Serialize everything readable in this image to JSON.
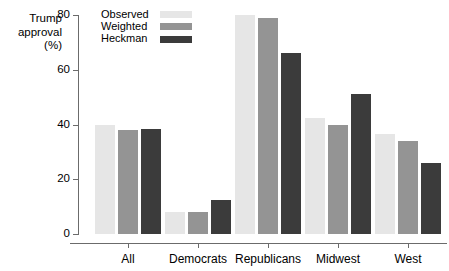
{
  "chart_data": {
    "type": "bar",
    "title": "",
    "ylabel": "Trump approval (%)",
    "ylabel_lines": [
      "Trump",
      "approval",
      "(%)"
    ],
    "xlabel": "",
    "categories": [
      "All",
      "Democrats",
      "Republicans",
      "Midwest",
      "West"
    ],
    "series": [
      {
        "name": "Observed",
        "color": "#e6e6e6",
        "values": [
          40,
          8,
          80,
          42.5,
          36.5
        ]
      },
      {
        "name": "Weighted",
        "color": "#949494",
        "values": [
          38,
          8,
          79,
          40,
          34
        ]
      },
      {
        "name": "Heckman",
        "color": "#3b3b3b",
        "values": [
          38.5,
          12.5,
          66,
          51,
          26
        ]
      }
    ],
    "ylim": [
      0,
      80
    ],
    "yticks": [
      0,
      20,
      40,
      60,
      80
    ],
    "ytick_labels": [
      "0",
      "20",
      "40",
      "60",
      "80"
    ],
    "grid": false,
    "legend_position": "top-left-inside",
    "axis_color": "#6b6b6b"
  }
}
